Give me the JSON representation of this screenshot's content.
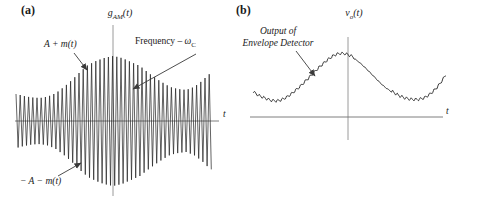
{
  "colors": {
    "ink": "#1f1f1f",
    "axis_horizontal": "#6f6f6f",
    "axis_vertical": "#9a9a9a",
    "arrow": "#3a3a3a",
    "background": "#ffffff"
  },
  "panel_a": {
    "label": "(a)",
    "axis_title": {
      "base": "g",
      "sub": "AM",
      "args": "(t)"
    },
    "x_axis_label": "t",
    "annotations": {
      "upper_envelope": {
        "text": "A + m(t)"
      },
      "frequency": {
        "prefix": "Frequency – ",
        "symbol": "ω",
        "sub": "C"
      },
      "lower_envelope": {
        "text": "− A − m(t)"
      }
    }
  },
  "panel_b": {
    "label": "(b)",
    "axis_title": {
      "base": "v",
      "sub": "o",
      "args": "(t)"
    },
    "x_axis_label": "t",
    "annotation": {
      "line1": "Output of",
      "line2": "Envelope Detector"
    }
  },
  "chart_data": [
    {
      "type": "line",
      "id": "am_signal",
      "title": "g_AM(t)",
      "xlabel": "t",
      "description": "Amplitude-modulated carrier oscillating at frequency ω_C, bounded above by envelope A + m(t) and below by −A − m(t); envelope peaks at the vertical axis and dips on either side",
      "carrier_period_px": 4.2,
      "envelope_amplitude_px": [
        [
          16,
          27
        ],
        [
          24,
          25
        ],
        [
          32,
          23.5
        ],
        [
          40,
          23
        ],
        [
          48,
          24.5
        ],
        [
          56,
          28
        ],
        [
          64,
          34
        ],
        [
          72,
          41
        ],
        [
          80,
          49
        ],
        [
          88,
          56
        ],
        [
          96,
          60
        ],
        [
          104,
          63
        ],
        [
          113,
          65
        ],
        [
          122,
          63
        ],
        [
          131,
          59
        ],
        [
          140,
          55
        ],
        [
          150,
          47
        ],
        [
          160,
          40
        ],
        [
          170,
          34
        ],
        [
          178,
          32
        ],
        [
          186,
          31
        ],
        [
          194,
          34
        ],
        [
          202,
          40
        ],
        [
          207,
          45
        ],
        [
          212,
          49
        ]
      ],
      "layout": {
        "axis_y": 121,
        "x_start": 16,
        "x_end": 212,
        "axis_x_end": 219,
        "v_axis_x": 113,
        "v_axis_top": 25,
        "v_axis_bottom": 196,
        "arrows": [
          [
            74,
            53,
            87,
            70
          ],
          [
            196,
            54,
            133,
            89
          ],
          [
            58,
            176,
            81,
            163
          ]
        ]
      }
    },
    {
      "type": "line",
      "id": "envelope_detector_output",
      "title": "v_o(t)",
      "xlabel": "t",
      "description": "Envelope-detector output: smooth recovered envelope with small sawtooth ripple, peaking just left of the vertical axis and dipping toward the axis on both sides",
      "baseline_px": [
        [
          253,
          93
        ],
        [
          259,
          97
        ],
        [
          266,
          100
        ],
        [
          272,
          102
        ],
        [
          279,
          102
        ],
        [
          286,
          99
        ],
        [
          293,
          94
        ],
        [
          301,
          87
        ],
        [
          310,
          78
        ],
        [
          319,
          69
        ],
        [
          328,
          61
        ],
        [
          336,
          56
        ],
        [
          343,
          55
        ],
        [
          350,
          57
        ],
        [
          357,
          61
        ],
        [
          365,
          68
        ],
        [
          373,
          76
        ],
        [
          382,
          85
        ],
        [
          391,
          92
        ],
        [
          399,
          97
        ],
        [
          407,
          100
        ],
        [
          415,
          101
        ],
        [
          422,
          100
        ],
        [
          428,
          97
        ],
        [
          434,
          92
        ],
        [
          440,
          85
        ],
        [
          446,
          76
        ]
      ],
      "ripple": {
        "period_px": 4.6,
        "amplitude_px": 3.0,
        "quiet_range_x": [
          354,
          392
        ],
        "quiet_amplitude_px": 0.9
      },
      "layout": {
        "axis_y": 117,
        "x_start": 251,
        "x_end": 443,
        "axis_x_end": 443,
        "v_axis_x": 348,
        "v_axis_top": 37,
        "v_axis_bottom": 140,
        "arrows": [
          [
            296,
            51,
            315,
            76
          ]
        ]
      }
    }
  ]
}
